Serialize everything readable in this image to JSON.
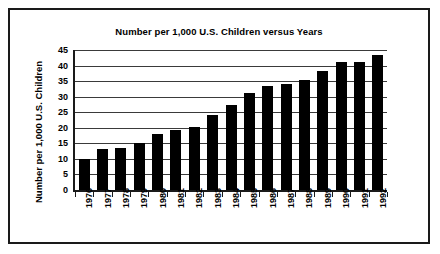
{
  "chart_data": {
    "type": "bar",
    "title": "Number per 1,000 U.S. Children versus Years",
    "xlabel": "",
    "ylabel": "Number per 1,000 U.S. Children",
    "categories": [
      "1976",
      "1977",
      "1978",
      "1979",
      "1980",
      "1981",
      "1982",
      "1983",
      "1984",
      "1985",
      "1986",
      "1987",
      "1988",
      "1989",
      "1990",
      "1991",
      "1992"
    ],
    "values": [
      10.0,
      13.1,
      13.5,
      15.0,
      18.1,
      19.4,
      20.2,
      24.2,
      27.3,
      31.3,
      33.3,
      34.2,
      35.3,
      38.3,
      41.2,
      41.2,
      43.3
    ],
    "ylim": [
      0,
      45
    ],
    "ytick_labels": [
      "45",
      "40",
      "35",
      "30",
      "25",
      "20",
      "15",
      "10",
      "5",
      "0"
    ],
    "ytick_values": [
      45,
      40,
      35,
      30,
      25,
      20,
      15,
      10,
      5,
      0
    ],
    "grid": true,
    "legend": false,
    "bar_color": "#000000",
    "gridline_color": "#3a3a3a",
    "axis_color": "#1a1a1a",
    "background_color": "#ffffff"
  }
}
